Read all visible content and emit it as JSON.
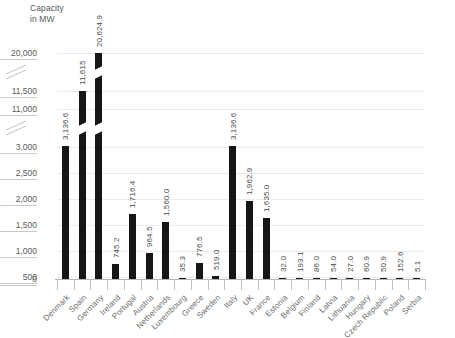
{
  "chart_data": {
    "type": "bar",
    "title": "Capacity\nin MW",
    "xlabel": "",
    "ylabel": "Capacity in MW",
    "grid": true,
    "legend": "none",
    "axis_broken": true,
    "axis_breaks": [
      [
        3000,
        11000
      ],
      [
        11500,
        20000
      ]
    ],
    "ytick_labels": [
      "20,000",
      "11,500",
      "11,000",
      "3.000",
      "2,500",
      "2,000",
      "1,500",
      "1,000",
      "500",
      "0"
    ],
    "ytick_values": [
      20000,
      11500,
      11000,
      3000,
      2500,
      2000,
      1500,
      1000,
      500,
      0
    ],
    "ylim": [
      0,
      21000
    ],
    "categories": [
      "Denmark",
      "Spain",
      "Germany",
      "Ireland",
      "Portugal",
      "Austria",
      "Netherlands",
      "Luxembourg",
      "Greece",
      "Sweden",
      "Italy",
      "UK",
      "France",
      "Estonia",
      "Belgium",
      "Finland",
      "Latvia",
      "Lithuania",
      "Hungary",
      "Czech Republic",
      "Poland",
      "Serbia"
    ],
    "values": [
      3136.6,
      11615,
      20624.9,
      745.2,
      1716.4,
      964.5,
      1560.0,
      35.3,
      776.5,
      519.0,
      3136.6,
      1962.9,
      1635.0,
      32.0,
      193.1,
      86.0,
      54.0,
      27.0,
      60.9,
      50.9,
      152.6,
      5.1
    ],
    "value_labels": [
      "3,136.6",
      "11,615",
      "20,624.9",
      "745.2",
      "1,716.4",
      "964.5",
      "1,560.0",
      "35.3",
      "776.5",
      "519.0",
      "3,136.6",
      "1,962.9",
      "1,635.0",
      "32.0",
      "193.1",
      "86.0",
      "54.0",
      "27.0",
      "60.9",
      "50.9",
      "152.6",
      "5.1"
    ],
    "bar_color": "#161616",
    "grid_color": "#ebebeb",
    "text_color": "#5a5a5a"
  }
}
